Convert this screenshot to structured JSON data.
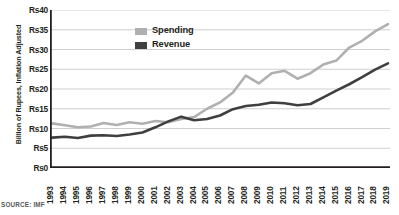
{
  "chart_data": {
    "type": "line",
    "title": "",
    "xlabel": "",
    "ylabel": "Billion of Rupees, Inflation Adjusted",
    "source": "SOURCE: IMF",
    "grid": true,
    "legend_position": "top-center",
    "ylim": [
      0,
      40
    ],
    "ytick_values": [
      0,
      5,
      10,
      15,
      20,
      25,
      30,
      35,
      40
    ],
    "ytick_labels": [
      "Rs0",
      "Rs5",
      "Rs10",
      "Rs15",
      "Rs20",
      "Rs25",
      "Rs30",
      "Rs35",
      "Rs40"
    ],
    "categories": [
      "1993",
      "1994",
      "1995",
      "1996",
      "1997",
      "1998",
      "1999",
      "2000",
      "2001",
      "2002",
      "2003",
      "2004",
      "2005",
      "2006",
      "2007",
      "2008",
      "2009",
      "2010",
      "2011",
      "2012",
      "2013",
      "2014",
      "2015",
      "2016",
      "2017",
      "2018",
      "2019"
    ],
    "series": [
      {
        "name": "Spending",
        "color": "#b0b0b0",
        "values": [
          11.3,
          10.8,
          10.3,
          10.5,
          11.4,
          10.9,
          11.6,
          11.2,
          11.9,
          11.6,
          12.4,
          12.9,
          15.0,
          16.6,
          19.1,
          23.4,
          21.4,
          24.0,
          24.6,
          22.6,
          24.0,
          26.2,
          27.2,
          30.5,
          32.2,
          34.6,
          36.4
        ]
      },
      {
        "name": "Revenue",
        "color": "#3f3f3f",
        "values": [
          7.7,
          7.9,
          7.6,
          8.2,
          8.3,
          8.1,
          8.5,
          9.0,
          10.3,
          11.8,
          13.0,
          12.1,
          12.4,
          13.3,
          14.9,
          15.7,
          16.0,
          16.6,
          16.4,
          15.9,
          16.2,
          17.9,
          19.6,
          21.2,
          23.0,
          24.9,
          26.5
        ]
      }
    ]
  },
  "legend": {
    "items": [
      {
        "label": "Spending",
        "color": "#b0b0b0"
      },
      {
        "label": "Revenue",
        "color": "#3f3f3f"
      }
    ]
  },
  "axis": {
    "y_title": "Billion of Rupees, Inflation Adjusted"
  },
  "footer": {
    "source": "SOURCE: IMF"
  }
}
